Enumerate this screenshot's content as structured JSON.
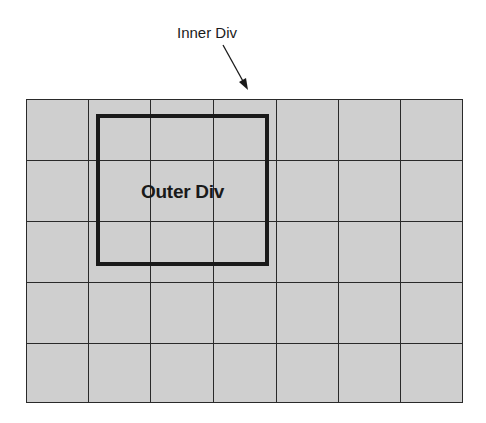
{
  "diagram": {
    "inner_label": "Inner Div",
    "outer_label": "Outer Div",
    "grid": {
      "columns": 7,
      "rows": 5
    },
    "colors": {
      "cell_fill": "#cfcfcf",
      "grid_line": "#2a2a2a",
      "box_border": "#1a1a1a",
      "background": "#ffffff"
    }
  }
}
